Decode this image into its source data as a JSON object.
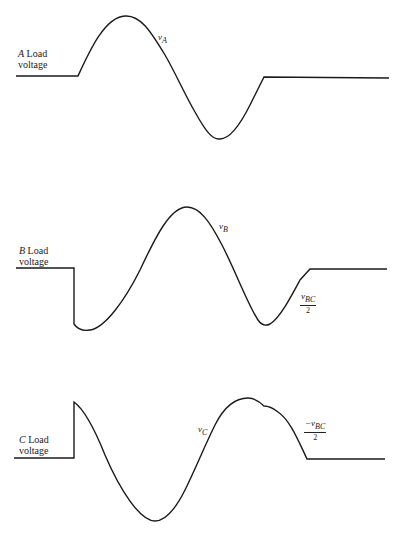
{
  "panels": [
    {
      "id": "A",
      "label_letter": "A",
      "label_line1": "Load",
      "label_line2": "voltage",
      "signal": {
        "base": "v",
        "sub": "A"
      }
    },
    {
      "id": "B",
      "label_letter": "B",
      "label_line1": "Load",
      "label_line2": "voltage",
      "signal": {
        "base": "v",
        "sub": "B"
      },
      "annotation": {
        "numerator_base": "v",
        "numerator_sub": "BC",
        "denominator": "2"
      }
    },
    {
      "id": "C",
      "label_letter": "C",
      "label_line1": "Load",
      "label_line2": "voltage",
      "signal": {
        "base": "v",
        "sub": "C"
      },
      "annotation": {
        "prefix": "−",
        "numerator_base": "v",
        "numerator_sub": "BC",
        "denominator": "2"
      }
    }
  ],
  "colors": {
    "stroke": "#1a1a1a",
    "background": "#ffffff"
  }
}
